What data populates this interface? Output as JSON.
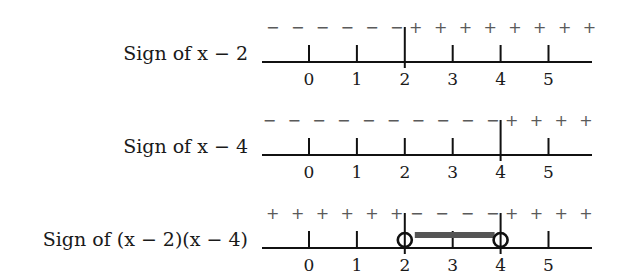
{
  "diagram": {
    "tick_values": [
      "0",
      "1",
      "2",
      "3",
      "4",
      "5"
    ],
    "rows": [
      {
        "label": "Sign of x − 2",
        "root": 2,
        "signs_left": [
          "−",
          "−",
          "−",
          "−",
          "−",
          "−"
        ],
        "signs_right": [
          "+",
          "+",
          "+",
          "+",
          "+",
          "+",
          "+",
          "+"
        ],
        "open_circles": [],
        "interval": null
      },
      {
        "label": "Sign of x − 4",
        "root": 4,
        "signs_left": [
          "−",
          "−",
          "−",
          "−",
          "−",
          "−",
          "−",
          "−",
          "−",
          "−"
        ],
        "signs_right": [
          "+",
          "+",
          "+",
          "+"
        ],
        "open_circles": [],
        "interval": null
      },
      {
        "label": "Sign of (x − 2)(x − 4)",
        "roots": [
          2,
          4
        ],
        "signs_left": [
          "+",
          "+",
          "+",
          "+",
          "+",
          "+"
        ],
        "signs_middle": [
          "−",
          "−",
          "−",
          "−"
        ],
        "signs_right": [
          "+",
          "+",
          "+",
          "+"
        ],
        "open_circles": [
          2,
          4
        ],
        "interval": [
          2,
          4
        ]
      }
    ]
  }
}
